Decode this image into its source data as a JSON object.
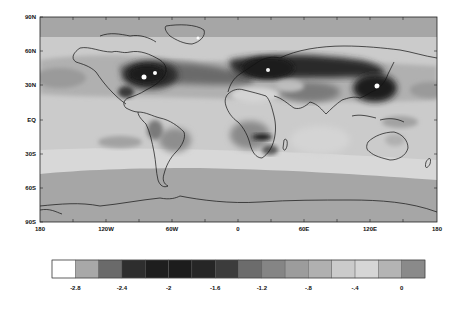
{
  "chart_data": {
    "type": "heatmap",
    "subtype": "global-map-filled-contour",
    "title": "",
    "xlabel": "",
    "ylabel": "",
    "x_ticks": [
      "180",
      "120W",
      "60W",
      "0",
      "60E",
      "120E",
      "180"
    ],
    "y_ticks": [
      "90N",
      "60N",
      "30N",
      "EQ",
      "30S",
      "60S",
      "90S"
    ],
    "xlim": [
      -180,
      180
    ],
    "ylim": [
      -90,
      90
    ],
    "colorbar": {
      "orientation": "horizontal",
      "levels": [
        -2.8,
        -2.6,
        -2.4,
        -2.2,
        -2.0,
        -1.8,
        -1.6,
        -1.4,
        -1.2,
        -1.0,
        -0.8,
        -0.6,
        -0.4,
        -0.2,
        0.0
      ],
      "tick_labels": [
        "-2.8",
        "-2.4",
        "-2",
        "-1.6",
        "-1.2",
        "-.8",
        "-.4",
        "0"
      ],
      "colors": [
        "#ffffff",
        "#a8a8a8",
        "#6a6a6a",
        "#2e2e2e",
        "#1e1e1e",
        "#1c1c1c",
        "#262626",
        "#3c3c3c",
        "#6c6c6c",
        "#858585",
        "#9c9c9c",
        "#b0b0b0",
        "#cbcbcb",
        "#d6d6d6",
        "#b4b4b4",
        "#8a8a8a"
      ]
    },
    "regions": [
      {
        "name": "Eastern North America",
        "approx_value": -2.2
      },
      {
        "name": "Europe",
        "approx_value": -2.2
      },
      {
        "name": "East Asia",
        "approx_value": -2.2
      },
      {
        "name": "North Atlantic",
        "approx_value": -1.4
      },
      {
        "name": "Central Africa",
        "approx_value": -1.8
      },
      {
        "name": "Tropics ocean",
        "approx_value": -0.4
      },
      {
        "name": "Southern Ocean 50S-80S",
        "approx_value": -0.8
      },
      {
        "name": "Arctic",
        "approx_value": -0.8
      }
    ]
  }
}
